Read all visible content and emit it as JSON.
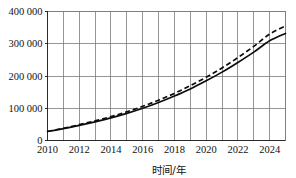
{
  "chart_data": {
    "type": "line",
    "title": "",
    "subtitle": "",
    "xlabel": "时间/年",
    "ylabel": "",
    "xlim": [
      2010,
      2025
    ],
    "ylim": [
      0,
      400000
    ],
    "grid": true,
    "legend_position": "none",
    "x_ticks": [
      2010,
      2012,
      2014,
      2016,
      2018,
      2020,
      2022,
      2024
    ],
    "x_tick_labels": [
      "2010",
      "2012",
      "2014",
      "2016",
      "2018",
      "2020",
      "2022",
      "2024"
    ],
    "x_minor_step": 1,
    "y_ticks": [
      0,
      100000,
      200000,
      300000,
      400000
    ],
    "y_tick_labels": [
      "0",
      "100 000",
      "200 000",
      "300 000",
      "400 000"
    ],
    "x": [
      2010,
      2011,
      2012,
      2013,
      2014,
      2015,
      2016,
      2017,
      2018,
      2019,
      2020,
      2021,
      2022,
      2023,
      2024,
      2025
    ],
    "series": [
      {
        "name": "solid-curve",
        "style": "solid",
        "color": "#0d0d0d",
        "values": [
          28000,
          37000,
          47000,
          58000,
          70000,
          84000,
          100000,
          118000,
          138000,
          160000,
          185000,
          212000,
          242000,
          274000,
          309000,
          332000
        ]
      },
      {
        "name": "dashed-curve",
        "style": "dashed",
        "color": "#0d0d0d",
        "values": [
          28000,
          38000,
          49000,
          61000,
          74000,
          89000,
          106000,
          125000,
          146000,
          170000,
          196000,
          225000,
          257000,
          292000,
          330000,
          355000
        ]
      }
    ]
  },
  "axis_labels": {
    "x_title": "时间/年"
  }
}
